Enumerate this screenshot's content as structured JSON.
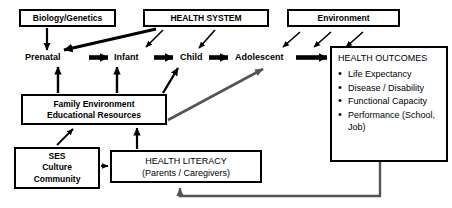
{
  "diagram": {
    "nodes": {
      "biology_genetics": {
        "label": "Biology/Genetics"
      },
      "health_system": {
        "label": "HEALTH SYSTEM"
      },
      "environment": {
        "label": "Environment"
      },
      "health_outcomes": {
        "title": "HEALTH OUTCOMES",
        "items": [
          "Life Expectancy",
          "Disease / Disability",
          "Functional Capacity",
          " Performance (School, Job)"
        ]
      },
      "family_environment": {
        "line1": "Family Environment",
        "line2": "Educational Resources"
      },
      "ses": {
        "line1": "SES",
        "line2": "Culture",
        "line3": "Community"
      },
      "health_literacy": {
        "line1": "HEALTH LITERACY",
        "line2": "(Parents / Caregivers)"
      }
    },
    "stages": [
      {
        "id": "prenatal",
        "label": "Prenatal"
      },
      {
        "id": "infant",
        "label": "Infant"
      },
      {
        "id": "child",
        "label": "Child"
      },
      {
        "id": "adolescent",
        "label": "Adolescent"
      }
    ],
    "colors": {
      "stroke": "#000000",
      "gray_arrow": "#555555",
      "background": "#ffffff",
      "text": "#000000"
    }
  }
}
